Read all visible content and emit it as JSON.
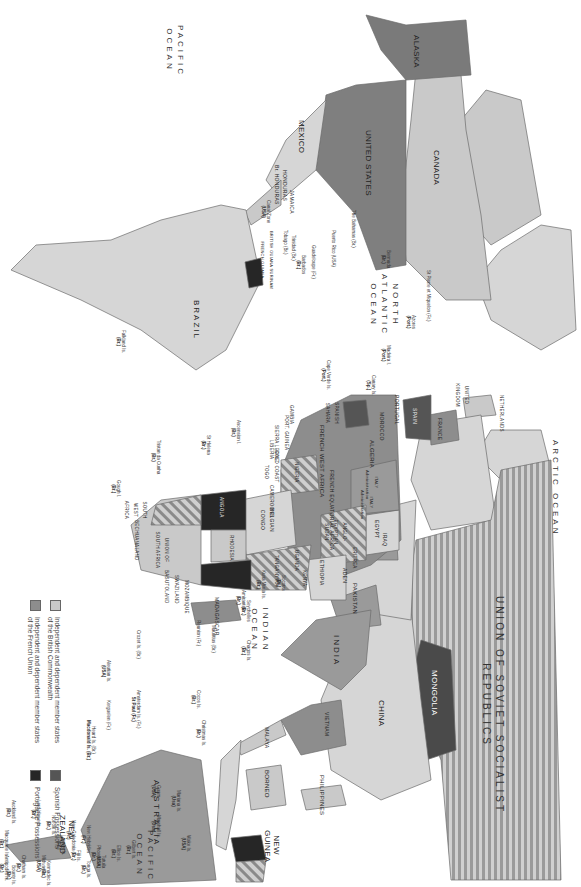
{
  "map": {
    "orientation": "rotated-90-clockwise",
    "oceans": [
      {
        "id": "arctic",
        "label": "ARCTIC OCEAN"
      },
      {
        "id": "pacific-east",
        "label": "PACIFIC OCEAN"
      },
      {
        "id": "pacific-west",
        "label": "PACIFIC OCEAN"
      },
      {
        "id": "north-atlantic",
        "label": "NORTH ATLANTIC OCEAN"
      },
      {
        "id": "indian",
        "label": "INDIAN OCEAN"
      }
    ],
    "countries": {
      "ussr": "UNION OF SOVIET SOCIALIST REPUBLICS",
      "mongolia": "MONGOLIA",
      "china": "CHINA",
      "india": "INDIA",
      "pakistan": "PAKISTAN",
      "vietnam": "VIETNAM",
      "malaya": "MALAYA",
      "borneo": "BORNEO",
      "philippines": "PHILIPPINES",
      "new_guinea": "NEW GUINEA",
      "australia": "AUSTRALIA",
      "new_zealand": "NEW ZEALAND",
      "iraq": "IRAQ",
      "aden": "ADEN",
      "eritrea": "ERITREA",
      "egypt": "EGYPT",
      "anglo_egyptian_sudan": "ANGLO-EGYPTIAN SUDAN",
      "ethiopia": "ETHIOPIA",
      "somaliland": "BRITISH SOMALILAND",
      "kenya": "KENYA",
      "uganda": "UGANDA",
      "tanganyika": "TANGANYIKA",
      "madagascar": "MADAGASCAR",
      "mozambique": "MOZAMBIQUE",
      "swaziland": "SWAZILAND",
      "basutoland": "BASUTOLAND",
      "union_of_south_africa": "UNION OF SOUTH AFRICA",
      "bechuanaland": "BECHUANALAND",
      "south_west_africa": "SOUTH WEST AFRICA",
      "angola": "ANGOLA",
      "belgian_congo": "BELGIAN CONGO",
      "rhodesia": "RHODESIA",
      "french_equatorial_africa": "FRENCH EQUATORIAL AFRICA",
      "nigeria": "NIGERIA",
      "cameroons": "CAMEROONS",
      "togo": "TOGO",
      "gold_coast": "GOLD COAST",
      "liberia": "LIBERIA",
      "sierra_leone": "SIERRA LEONE",
      "port_guinea": "PORT. GUINEA",
      "gambia": "GAMBIA",
      "french_west_africa": "FRENCH WEST AFRICA",
      "algeria": "ALGERIA",
      "morocco": "MOROCCO",
      "spanish_sahara": "SPANISH SAHARA",
      "libya_tripoli": "ITALY Administration",
      "libya_fezzan": "ITALY Administration",
      "portugal": "PORTUGAL",
      "spain": "SPAIN",
      "france": "FRANCE",
      "united_kingdom": "UNITED KINGDOM",
      "netherlands": "NETHERLANDS",
      "canada": "CANADA",
      "alaska": "ALASKA",
      "united_states": "UNITED STATES",
      "mexico": "MEXICO",
      "honduras": "HONDURAS",
      "br_honduras": "Br. HONDURAS",
      "jamaica": "JAMAICA",
      "brazil": "BRAZIL",
      "guianas": "BRITISH GUIANA  SURINAM  FRENCH GUIANA"
    },
    "islands": [
      {
        "id": "aleutian",
        "name": "Aleutian Is.",
        "owner": "(USA)"
      },
      {
        "id": "midway",
        "name": "Midway Is.",
        "owner": "(USA)"
      },
      {
        "id": "wake",
        "name": "Wake Is.",
        "owner": "(USA)"
      },
      {
        "id": "marshall",
        "name": "Marshall Is.",
        "owner": "(Usa)"
      },
      {
        "id": "marianas",
        "name": "Mariana Is.",
        "owner": "(Usa)"
      },
      {
        "id": "guam",
        "name": "Guam",
        "owner": "(USA)"
      },
      {
        "id": "gilbert",
        "name": "Gilbert Is.",
        "owner": "(Br.)"
      },
      {
        "id": "ellice",
        "name": "Ellice Is.",
        "owner": "(Br.)"
      },
      {
        "id": "tutuila",
        "name": "Tutuila",
        "owner": "(USA)"
      },
      {
        "id": "tonga",
        "name": "Tonga Is.",
        "owner": "(Br.)"
      },
      {
        "id": "phoenix",
        "name": "Phoenix Is.",
        "owner": "(Br.)"
      },
      {
        "id": "fiji",
        "name": "Fiji Is.",
        "owner": "(Br.)"
      },
      {
        "id": "new_hebrides",
        "name": "New Hebrides",
        "owner": "(Fr.)"
      },
      {
        "id": "new_caledonia",
        "name": "New Caledonia",
        "owner": "(Fr.)"
      },
      {
        "id": "loyalty",
        "name": "Loyalty Is.",
        "owner": "(Fr.)"
      },
      {
        "id": "norfolk",
        "name": "Norfolk Is.",
        "owner": "(Br.)"
      },
      {
        "id": "kermadec",
        "name": "Kermadec Is.",
        "owner": "(Br.)"
      },
      {
        "id": "lord_howe",
        "name": "Lord Howe Is.",
        "owner": "(Br.)"
      },
      {
        "id": "chatham",
        "name": "Chatham Is.",
        "owner": "(Br.)"
      },
      {
        "id": "bounty",
        "name": "Bounty Is.",
        "owner": "(Br.)"
      },
      {
        "id": "antipodes",
        "name": "Antipodes Is.",
        "owner": "(Br.)"
      },
      {
        "id": "auckland",
        "name": "Auckland Is.",
        "owner": "(Br.)"
      },
      {
        "id": "macquarie",
        "name": "Macquarie Is.",
        "owner": "(Br.)"
      },
      {
        "id": "christmas",
        "name": "Christmas Is.",
        "owner": "(Br.)"
      },
      {
        "id": "cocos",
        "name": "Cocos Is.",
        "owner": "(Br.)"
      },
      {
        "id": "chagos",
        "name": "Chagos Is.",
        "owner": "(Br.)"
      },
      {
        "id": "amsterdam",
        "name": "Amsterdam Is. (Fr.)",
        "owner": "St Paul (Fr.)"
      },
      {
        "id": "kerguelen",
        "name": "Kerguelen (Fr.)",
        "owner": ""
      },
      {
        "id": "heard",
        "name": "Heard Is. (Br.)",
        "owner": "Macdonald Is. (Br.)"
      },
      {
        "id": "crozet",
        "name": "Crozet Is. (Br.)",
        "owner": ""
      },
      {
        "id": "kuria_muria",
        "name": "Kuria Muria Is.",
        "owner": "(Br.)"
      },
      {
        "id": "socotra",
        "name": "Socotra",
        "owner": "(Br.)"
      },
      {
        "id": "seychelles",
        "name": "Seychelles",
        "owner": "(Br.)"
      },
      {
        "id": "amirantes",
        "name": "Amirantes",
        "owner": "(Br.)"
      },
      {
        "id": "mauritius",
        "name": "Mauritius (Br.)",
        "owner": ""
      },
      {
        "id": "reunion",
        "name": "Reunion (Fr.)",
        "owner": ""
      },
      {
        "id": "st_helena",
        "name": "St Helena",
        "owner": "(Br.)"
      },
      {
        "id": "ascension",
        "name": "Ascension I.",
        "owner": "(Br.)"
      },
      {
        "id": "tristan",
        "name": "Tristan da Cunha",
        "owner": "(Br.)"
      },
      {
        "id": "gough",
        "name": "Gough I.",
        "owner": "(Br.)"
      },
      {
        "id": "falkland",
        "name": "Falkland Is.",
        "owner": "(Br.)"
      },
      {
        "id": "canary",
        "name": "Canary Is.",
        "owner": "(Sp.)"
      },
      {
        "id": "madeira",
        "name": "Madeira I.",
        "owner": "(Port.)"
      },
      {
        "id": "azores",
        "name": "Azores",
        "owner": "(Port.)"
      },
      {
        "id": "cape_verde",
        "name": "Cape Verde Is.",
        "owner": "(Port.)"
      },
      {
        "id": "st_pierre",
        "name": "St Pierre et Miquelon (Fr.)",
        "owner": ""
      },
      {
        "id": "bermuda",
        "name": "Bermuda",
        "owner": "(Br.)"
      },
      {
        "id": "bahamas",
        "name": "The Bahamas (Br.)",
        "owner": ""
      },
      {
        "id": "puerto_rico",
        "name": "Puerto Rico (USA)",
        "owner": ""
      },
      {
        "id": "guadeloupe",
        "name": "Guadeloupe (Fr.)",
        "owner": ""
      },
      {
        "id": "barbados",
        "name": "Barbados",
        "owner": "(Br.)"
      },
      {
        "id": "trinidad",
        "name": "Trinidad (Br.)",
        "owner": ""
      },
      {
        "id": "tobago",
        "name": "Tobago (Br.)",
        "owner": ""
      },
      {
        "id": "canal_zone",
        "name": "Canal Zone",
        "owner": "(USA)"
      }
    ]
  },
  "legend": {
    "items": [
      {
        "label_line1": "Independent and dependent member states",
        "label_line2": "of the British Commonwealth",
        "color": "#c9c9c9"
      },
      {
        "label_line1": "Independent and dependent member states",
        "label_line2": "of the French Union",
        "color": "#8d8d8d"
      },
      {
        "label_line1": "Spanish Possessions",
        "label_line2": "",
        "color": "#555555"
      },
      {
        "label_line1": "Portuguese Possessions",
        "label_line2": "",
        "color": "#262626"
      }
    ]
  },
  "colors": {
    "british": "#c9c9c9",
    "french": "#8d8d8d",
    "spanish": "#555555",
    "portuguese": "#262626",
    "other_land": "#d6d6d6",
    "usa": "#7f7f7f",
    "border": "#6b6b6b",
    "ocean": "#ffffff"
  }
}
